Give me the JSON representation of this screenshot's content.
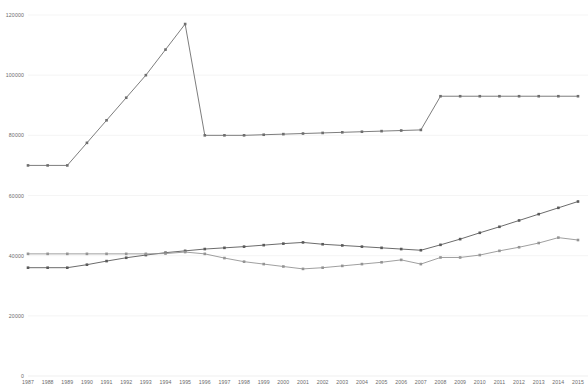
{
  "chart_data": {
    "type": "line",
    "title": "",
    "subtitle": "",
    "xlabel": "",
    "ylabel": "",
    "grid": true,
    "legend_position": "none",
    "xlim": [
      1987,
      2015
    ],
    "ylim": [
      0,
      120000
    ],
    "y_ticks": [
      0,
      20000,
      40000,
      60000,
      80000,
      100000,
      120000
    ],
    "y_tick_labels": [
      "0",
      "20000",
      "40000",
      "60000",
      "80000",
      "100000",
      "120000"
    ],
    "categories": [
      "1987",
      "1988",
      "1989",
      "1990",
      "1991",
      "1992",
      "1993",
      "1994",
      "1995",
      "1996",
      "1997",
      "1998",
      "1999",
      "2000",
      "2001",
      "2002",
      "2003",
      "2004",
      "2005",
      "2006",
      "2007",
      "2008",
      "2009",
      "2010",
      "2011",
      "2012",
      "2013",
      "2014",
      "2015"
    ],
    "series": [
      {
        "name": "series-upper",
        "color": "#6e6e6e",
        "values": [
          70000,
          70000,
          70000,
          77500,
          85000,
          92500,
          100000,
          108500,
          117000,
          80000,
          80000,
          80000,
          80200,
          80400,
          80600,
          80800,
          81000,
          81200,
          81400,
          81600,
          81800,
          93000,
          93000,
          93000,
          93000,
          93000,
          93000,
          93000,
          93000
        ]
      },
      {
        "name": "series-middle",
        "color": "#5a5a5a",
        "values": [
          36000,
          36000,
          36000,
          37000,
          38200,
          39300,
          40200,
          41000,
          41600,
          42200,
          42600,
          43000,
          43500,
          44000,
          44400,
          43800,
          43400,
          43000,
          42600,
          42200,
          41800,
          43600,
          45500,
          47600,
          49600,
          51700,
          53800,
          55900,
          58000
        ]
      },
      {
        "name": "series-lower",
        "color": "#949494",
        "values": [
          40600,
          40600,
          40600,
          40600,
          40600,
          40600,
          40600,
          40700,
          41200,
          40600,
          39200,
          38000,
          37200,
          36400,
          35600,
          36000,
          36600,
          37200,
          37800,
          38600,
          37200,
          39400,
          39400,
          40200,
          41600,
          42800,
          44200,
          46000,
          45200
        ]
      }
    ]
  }
}
